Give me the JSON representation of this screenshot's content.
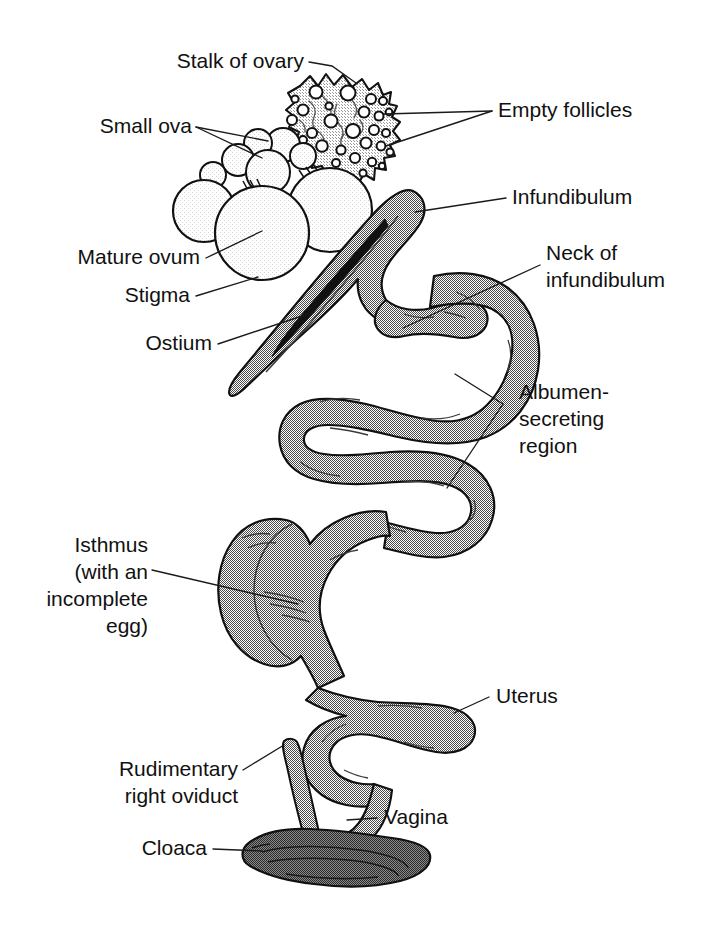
{
  "figure": {
    "background_color": "#ffffff",
    "ink_color": "#111111",
    "tract_fill_color": "#9a9a9a",
    "tract_fill_dark_color": "#7d7d7d",
    "stalk_fill_color": "#ececec",
    "ovum_fill_color": "#fbfbfb",
    "leader_color": "#1a1a1a"
  },
  "labels": {
    "stalk_of_ovary": "Stalk of ovary",
    "small_ova": "Small ova",
    "empty_follicles": "Empty follicles",
    "infundibulum": "Infundibulum",
    "neck_of_infundibulum_line1": "Neck of",
    "neck_of_infundibulum_line2": "infundibulum",
    "mature_ovum": "Mature ovum",
    "stigma": "Stigma",
    "ostium": "Ostium",
    "albumen_line1": "Albumen-",
    "albumen_line2": "secreting",
    "albumen_line3": "region",
    "isthmus_line1": "Isthmus",
    "isthmus_line2": "(with an",
    "isthmus_line3": "incomplete",
    "isthmus_line4": "egg)",
    "uterus": "Uterus",
    "rudimentary_line1": "Rudimentary",
    "rudimentary_line2": "right oviduct",
    "vagina": "Vagina",
    "cloaca": "Cloaca"
  },
  "parts": {
    "ovary_stalk": "stalk-of-ovary",
    "small_ova": "small-ova-cluster",
    "empty_follicles": "empty-follicles",
    "mature_ovum": "mature-ovum",
    "stigma": "stigma-line",
    "infundibulum": "infundibulum-funnel",
    "ostium": "ostium-slit",
    "neck_of_infundibulum": "neck-of-infundibulum",
    "magnum": "albumen-secreting-region",
    "isthmus": "isthmus-with-incomplete-egg",
    "uterus": "uterus-shell-gland",
    "vagina": "vagina",
    "rudimentary_right_oviduct": "rudimentary-right-oviduct",
    "cloaca": "cloaca"
  }
}
